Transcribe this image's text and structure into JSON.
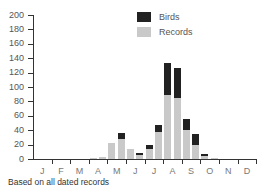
{
  "chart_data": {
    "type": "bar",
    "stacked": true,
    "title": "",
    "xlabel": "",
    "ylabel": "",
    "ylim": [
      0,
      200
    ],
    "yticks": [
      0,
      20,
      40,
      60,
      80,
      100,
      120,
      140,
      160,
      180,
      200
    ],
    "month_labels": [
      "J",
      "F",
      "M",
      "A",
      "M",
      "J",
      "J",
      "A",
      "S",
      "O",
      "N",
      "D"
    ],
    "categories": [
      "Apr-1",
      "Apr-2",
      "May-1",
      "May-2",
      "Jun-1",
      "Jun-2",
      "Jul-1",
      "Jul-2",
      "Aug-1",
      "Aug-2",
      "Sep-1",
      "Sep-2",
      "Oct-1",
      "Oct-2"
    ],
    "series": [
      {
        "name": "Records",
        "color": "#c9c9c9",
        "values": [
          2,
          3,
          22,
          28,
          14,
          6,
          14,
          38,
          89,
          85,
          40,
          20,
          4,
          2
        ]
      },
      {
        "name": "Birds",
        "color": "#222222",
        "values": [
          0,
          0,
          0,
          8,
          0,
          2,
          6,
          9,
          44,
          41,
          15,
          15,
          3,
          0
        ]
      }
    ],
    "legend": [
      "Birds",
      "Records"
    ],
    "legend_position": "top-right",
    "grid": false,
    "footnote": "Based on all dated records"
  },
  "legend": {
    "birds": "Birds",
    "records": "Records"
  },
  "footnote": "Based on all dated records"
}
